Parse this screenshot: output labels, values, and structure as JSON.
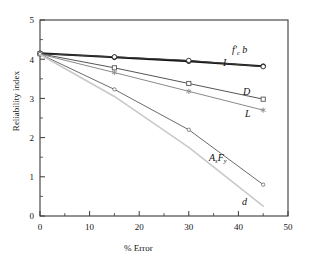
{
  "figure": {
    "name": "reliability-index-vs-percent-error"
  },
  "axes": {
    "xlabel": "% Error",
    "ylabel": "Reliability index",
    "xticks": [
      "0",
      "10",
      "20",
      "30",
      "40",
      "50"
    ],
    "yticks": [
      "0",
      "1",
      "2",
      "3",
      "4",
      "5"
    ],
    "xlim": [
      0,
      50
    ],
    "ylim": [
      0,
      5
    ],
    "x_minor_step": 5,
    "y_minor_step": 0.5,
    "frame_color": "#3a3a3a"
  },
  "labels": {
    "fcb": "f'c b",
    "fcb_base": "f",
    "fcb_sub": "c",
    "fcb_tail": " b",
    "I": "I",
    "D": "D",
    "L": "L",
    "AsFy_A": "A",
    "AsFy_s": "s",
    "AsFy_F": "F",
    "AsFy_y": "y",
    "d": "d"
  },
  "chart_data": {
    "type": "line",
    "title": "",
    "xlabel": "% Error",
    "ylabel": "Reliability index",
    "xlim": [
      0,
      50
    ],
    "ylim": [
      0,
      5
    ],
    "grid": false,
    "legend": "inline-annotations",
    "x": [
      0,
      15,
      30,
      45
    ],
    "series": [
      {
        "name": "f'c b",
        "label": "f'c b",
        "values": [
          4.15,
          4.05,
          3.95,
          3.82
        ],
        "color": "#141414",
        "marker": "filled-circle",
        "linewidth": 2.0
      },
      {
        "name": "I",
        "label": "I",
        "values": [
          4.14,
          4.06,
          3.97,
          3.81
        ],
        "color": "#3c3c3c",
        "marker": "open-circle",
        "linewidth": 1.0
      },
      {
        "name": "D",
        "label": "D",
        "values": [
          4.14,
          3.78,
          3.38,
          2.98
        ],
        "color": "#555555",
        "marker": "open-square",
        "linewidth": 1.0
      },
      {
        "name": "L",
        "label": "L",
        "values": [
          4.13,
          3.66,
          3.18,
          2.7
        ],
        "color": "#8a8a8a",
        "marker": "star",
        "linewidth": 1.0
      },
      {
        "name": "As Fy",
        "label": "As Fy",
        "values": [
          4.13,
          3.23,
          2.2,
          0.8
        ],
        "color": "#6b6b6b",
        "marker": "open-circle-small",
        "linewidth": 1.0
      },
      {
        "name": "d",
        "label": "d",
        "values": [
          4.12,
          3.05,
          1.75,
          0.25
        ],
        "color": "#c9c9c9",
        "marker": "none",
        "linewidth": 1.6
      }
    ]
  }
}
